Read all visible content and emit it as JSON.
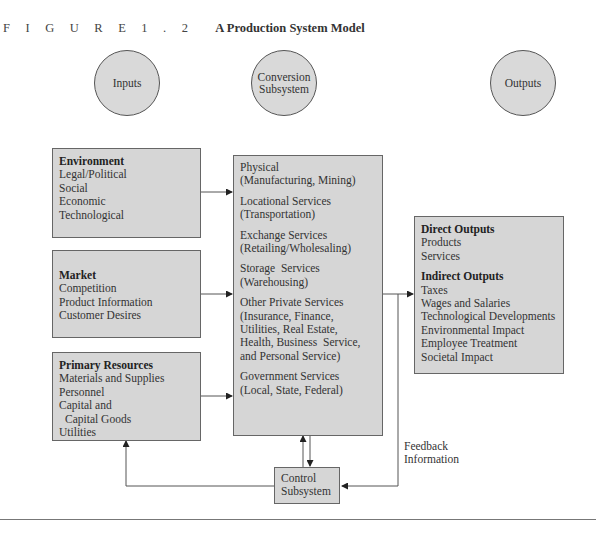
{
  "caption": {
    "figure_label": "F I G U R E  1 . 2",
    "title": "A Production System Model"
  },
  "circles": [
    {
      "id": "inputs",
      "label_lines": [
        "Inputs"
      ]
    },
    {
      "id": "conversion",
      "label_lines": [
        "Conversion",
        "Subsystem"
      ]
    },
    {
      "id": "outputs",
      "label_lines": [
        "Outputs"
      ]
    }
  ],
  "inputs": {
    "environment": {
      "heading": "Environment",
      "items": [
        "Legal/Political",
        "Social",
        "Economic",
        "Technological"
      ]
    },
    "market": {
      "heading": "Market",
      "items": [
        "Competition",
        "Product Information",
        "Customer Desires"
      ]
    },
    "primary_resources": {
      "heading": "Primary Resources",
      "items": [
        "Materials and Supplies",
        "Personnel",
        "Capital and",
        "Capital Goods",
        "Utilities"
      ]
    }
  },
  "conversion": {
    "groups": [
      {
        "name": "Physical",
        "detail": "(Manufacturing, Mining)"
      },
      {
        "name": "Locational Services",
        "detail": "(Transportation)"
      },
      {
        "name": "Exchange Services",
        "detail": "(Retailing/Wholesaling)"
      },
      {
        "name": "Storage  Services",
        "detail": "(Warehousing)"
      },
      {
        "name": "Other Private Services",
        "detail_lines": [
          "(Insurance, Finance,",
          "Utilities, Real Estate,",
          "Health, Business  Service,",
          "and Personal Service)"
        ]
      },
      {
        "name": "Government Services",
        "detail": "(Local, State, Federal)"
      }
    ]
  },
  "outputs": {
    "direct": {
      "heading": "Direct Outputs",
      "items": [
        "Products",
        "Services"
      ]
    },
    "indirect": {
      "heading": "Indirect Outputs",
      "items": [
        "Taxes",
        "Wages and Salaries",
        "Technological Developments",
        "Environmental Impact",
        "Employee Treatment",
        "Societal Impact"
      ]
    }
  },
  "control": {
    "label_lines": [
      "Control",
      "Subsystem"
    ]
  },
  "feedback": {
    "label_lines": [
      "Feedback",
      "Information"
    ]
  },
  "colors": {
    "box_fill": "#d6d6d6",
    "circle_fill": "#d9d9d9",
    "stroke": "#555555"
  }
}
